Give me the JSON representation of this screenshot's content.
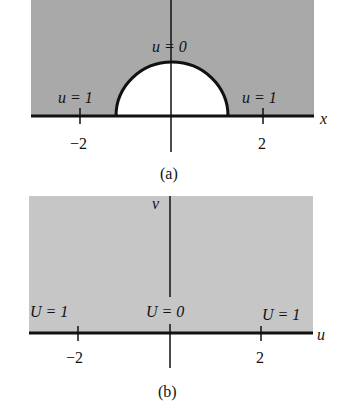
{
  "colors": {
    "region_a": "#a9a9a9",
    "region_b": "#c6c6c6",
    "axis": "#111111",
    "hole": "#ffffff"
  },
  "panel_a": {
    "caption": "(a)",
    "x_axis_label": "x",
    "ticks": [
      "−2",
      "2"
    ],
    "labels": {
      "top": "u = 0",
      "left": "u = 1",
      "right": "u = 1"
    }
  },
  "panel_b": {
    "caption": "(b)",
    "x_axis_label": "u",
    "y_axis_label": "v",
    "ticks": [
      "−2",
      "2"
    ],
    "labels": {
      "left": "U = 1",
      "center": "U = 0",
      "right": "U = 1"
    }
  }
}
